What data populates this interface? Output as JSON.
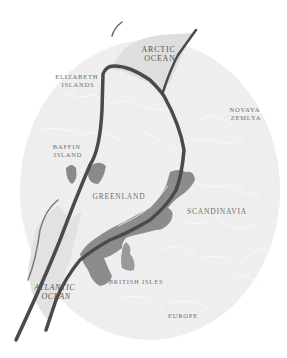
{
  "map": {
    "title": "North Atlantic rift region map",
    "colors": {
      "background": "#ffffff",
      "globe": "#ededed",
      "globe_edge": "#f6f6f6",
      "ocean_shade": "#dcdcdc",
      "land_lines": "#fbfbfb",
      "deposit_fill": "#8a8a8a",
      "rift_line": "#4a4a4a",
      "label": "#6e6e6e"
    },
    "labels": {
      "arctic_ocean_line1": "ARCTIC",
      "arctic_ocean_line2": "OCEAN",
      "elizabeth_line1": "ELIZABETH",
      "elizabeth_line2": "ISLANDS",
      "novaya_line1": "NOVAYA",
      "novaya_line2": "ZEMLYA",
      "baffin_line1": "BAFFIN",
      "baffin_line2": "ISLAND",
      "greenland": "GREENLAND",
      "scandinavia": "SCANDINAVIA",
      "british_isles": "BRITISH ISLES",
      "atlantic_line1": "ATLANTIC",
      "atlantic_line2": "OCEAN",
      "europe": "EUROPE"
    }
  }
}
